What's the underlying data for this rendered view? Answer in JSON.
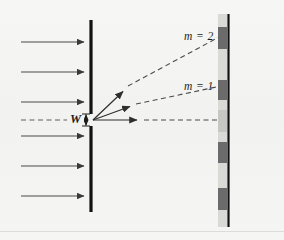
{
  "figure": {
    "background_color": "#f4f4f2",
    "width": 284,
    "height": 240
  },
  "labels": {
    "order_two": "m = 2",
    "order_one": "m = 1",
    "slit_width": "W"
  },
  "colors": {
    "barrier": "#121212",
    "screen_line": "#111111",
    "ray": "#3a3a3a",
    "fringe_bright": "#6f6f6f",
    "fringe_dim": "#9b9b9b",
    "screen_strip": "#d8d8d4",
    "axis_dash": "#555555",
    "border": "#d9d9d6"
  },
  "barrier": {
    "x": 91,
    "top_segment": {
      "y1": 20,
      "y2": 114
    },
    "bottom_segment": {
      "y1": 126,
      "y2": 212
    },
    "slit_gap": {
      "y1": 114,
      "y2": 126
    },
    "thickness": 3
  },
  "incoming_waves": {
    "count": 6,
    "x_start": 21,
    "x_end": 86,
    "y_positions": [
      42,
      72,
      102,
      136,
      166,
      196
    ],
    "direction": "right"
  },
  "central_axis": {
    "y": 120,
    "x_start": 21,
    "x_end": 68,
    "style": "dashed"
  },
  "rays": [
    {
      "name": "m2-ray",
      "order": 2,
      "label": "m = 2",
      "x1": 93,
      "y1": 120,
      "arrow_x": 126,
      "arrow_y": 89,
      "x2": 221,
      "y2": 38
    },
    {
      "name": "m1-ray",
      "order": 1,
      "label": "m = 1",
      "x1": 93,
      "y1": 120,
      "arrow_x": 133,
      "arrow_y": 105,
      "x2": 221,
      "y2": 88
    },
    {
      "name": "central-ray",
      "order": 0,
      "label": "",
      "x1": 93,
      "y1": 120,
      "arrow_x": 140,
      "arrow_y": 120,
      "x2": 221,
      "y2": 120
    }
  ],
  "screen": {
    "line_x": 228,
    "line_y1": 14,
    "line_y2": 227,
    "strip_x": 218,
    "strip_width": 9,
    "strip_y1": 14,
    "strip_y2": 227
  },
  "fringes": [
    {
      "name": "fringe-m2-upper",
      "y": 27,
      "height": 22,
      "shade": "#6b6b6b"
    },
    {
      "name": "fringe-m1-upper",
      "y": 80,
      "height": 20,
      "shade": "#6b6b6b"
    },
    {
      "name": "fringe-central",
      "y": 110,
      "height": 22,
      "shade": "#c6c6c2"
    },
    {
      "name": "fringe-m1-lower",
      "y": 142,
      "height": 21,
      "shade": "#6b6b6b"
    },
    {
      "name": "fringe-m2-lower",
      "y": 188,
      "height": 22,
      "shade": "#6b6b6b"
    }
  ],
  "label_positions": {
    "order_two": {
      "x": 184,
      "y": 31
    },
    "order_one": {
      "x": 184,
      "y": 81
    },
    "slit_width": {
      "x": 71,
      "y": 113
    }
  }
}
